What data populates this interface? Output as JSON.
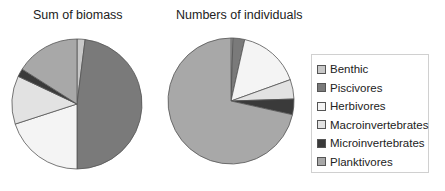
{
  "chart_data": [
    {
      "type": "pie",
      "title": "Sum of biomass",
      "categories": [
        "Benthic",
        "Piscivores",
        "Herbivores",
        "Macroinvertebrates",
        "Microinvertebrates",
        "Planktivores"
      ],
      "values": [
        2,
        48,
        20,
        12,
        2,
        16
      ],
      "unit": "percent (estimated)",
      "start_angle": "12 o'clock, clockwise"
    },
    {
      "type": "pie",
      "title": "Numbers of individuals",
      "categories": [
        "Benthic",
        "Piscivores",
        "Herbivores",
        "Macroinvertebrates",
        "Microinvertebrates",
        "Planktivores"
      ],
      "values": [
        0.5,
        3,
        16,
        5,
        4,
        71.5
      ],
      "unit": "percent (estimated)",
      "start_angle": "12 o'clock, clockwise"
    }
  ],
  "legend": {
    "position": "right",
    "items": [
      {
        "label": "Benthic",
        "color": "#c8c8c8"
      },
      {
        "label": "Piscivores",
        "color": "#7a7a7a"
      },
      {
        "label": "Herbivores",
        "color": "#f4f4f4"
      },
      {
        "label": "Macroinvertebrates",
        "color": "#e2e2e2"
      },
      {
        "label": "Microinvertebrates",
        "color": "#3a3a3a"
      },
      {
        "label": "Planktivores",
        "color": "#a8a8a8"
      }
    ]
  },
  "titles": {
    "left": "Sum of biomass",
    "right": "Numbers of individuals"
  }
}
